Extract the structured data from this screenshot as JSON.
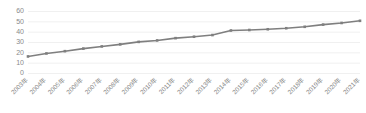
{
  "chart_data": {
    "type": "line",
    "title": "",
    "subtitle": "",
    "xlabel": "",
    "ylabel": "",
    "categories": [
      "2003年",
      "2004年",
      "2005年",
      "2006年",
      "2007年",
      "2008年",
      "2009年",
      "2010年",
      "2011年",
      "2012年",
      "2013年",
      "2014年",
      "2015年",
      "2016年",
      "2017年",
      "2018年",
      "2019年",
      "2020年",
      "2021年"
    ],
    "series": [
      {
        "name": "",
        "color": "#7f7f7f",
        "values": [
          16.5,
          19.4,
          21.6,
          24.1,
          26.2,
          28.2,
          30.6,
          32.0,
          34.2,
          35.6,
          37.2,
          41.6,
          42.1,
          42.8,
          43.8,
          45.2,
          47.3,
          48.9,
          51.0
        ]
      }
    ],
    "ylim": [
      0,
      60
    ],
    "yticks": [
      0,
      10,
      20,
      30,
      40,
      50,
      60
    ],
    "ytick_labels": [
      "0",
      "10",
      "20",
      "30",
      "40",
      "50",
      "60"
    ],
    "grid": true,
    "grid_axis": "y",
    "grid_color": "#e9e9e9",
    "legend": false,
    "legend_position": "none",
    "marker": "square",
    "xtick_rotation": -45,
    "axis_label_color": "#8a8a8a",
    "background_color": "#ffffff"
  }
}
